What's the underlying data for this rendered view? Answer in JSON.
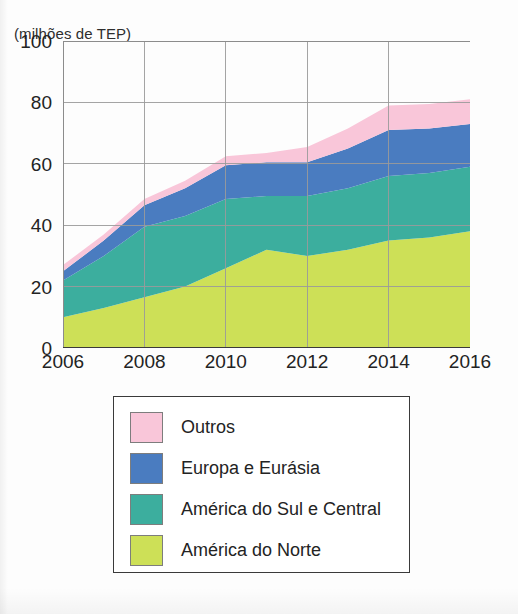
{
  "axis_unit_caption": "(milhões de TEP)",
  "credit": "Ericson Guilherme Luciano/Arquivo da editora",
  "legend": {
    "items": [
      {
        "label": "Outros",
        "color": "#f9c6d9"
      },
      {
        "label": "Europa e Eurásia",
        "color": "#4a7cc0"
      },
      {
        "label": "América do Sul e Central",
        "color": "#3cae9e"
      },
      {
        "label": "América do Norte",
        "color": "#cde057"
      }
    ]
  },
  "chart_data": {
    "type": "area",
    "stacked": true,
    "title": "",
    "subtitle": "",
    "xlabel": "",
    "ylabel": "(milhões de TEP)",
    "xlim": [
      2006,
      2016
    ],
    "ylim": [
      0,
      100
    ],
    "ytick_values": [
      0,
      20,
      40,
      60,
      80,
      100
    ],
    "ytick_labels": [
      "0",
      "20",
      "40",
      "60",
      "80",
      "100"
    ],
    "xtick_values": [
      2006,
      2008,
      2010,
      2012,
      2014,
      2016
    ],
    "xtick_labels": [
      "2006",
      "2008",
      "2010",
      "2012",
      "2014",
      "2016"
    ],
    "grid": true,
    "grid_color": "#9a9a9a",
    "legend_position": "below",
    "x": [
      2006,
      2007,
      2008,
      2009,
      2010,
      2011,
      2012,
      2013,
      2014,
      2015,
      2016
    ],
    "series": [
      {
        "name": "América do Norte",
        "color": "#cde057",
        "values": [
          10,
          13,
          16.5,
          20,
          26,
          32,
          30,
          32,
          35,
          36,
          38
        ]
      },
      {
        "name": "América do Sul e Central",
        "color": "#3cae9e",
        "values": [
          12,
          17,
          23,
          23,
          22.5,
          17.5,
          19.5,
          20,
          21,
          21,
          21
        ]
      },
      {
        "name": "Europa e Eurásia",
        "color": "#4a7cc0",
        "values": [
          3,
          5,
          7,
          9,
          11,
          11,
          11,
          13,
          15,
          14.5,
          14
        ]
      },
      {
        "name": "Outros",
        "color": "#f9c6d9",
        "values": [
          2,
          2,
          2,
          2.5,
          3,
          3,
          5,
          6.5,
          8,
          8,
          8
        ]
      }
    ],
    "totals": [
      27,
      37,
      48.5,
      54.5,
      62.5,
      63.5,
      65.5,
      71.5,
      79,
      79.5,
      81
    ]
  }
}
